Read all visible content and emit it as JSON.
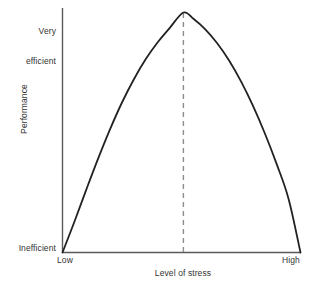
{
  "chart_data": {
    "type": "line",
    "title": "",
    "subtitle": "",
    "xlabel": "Level of stress",
    "ylabel": "Performance",
    "x_tick_labels": [
      "Low",
      "High"
    ],
    "y_tick_labels": [
      "Inefficient",
      "Very efficient"
    ],
    "y_top_label_lines": [
      "Very",
      "efficient"
    ],
    "grid": false,
    "legend": "none",
    "xlim": [
      0,
      1
    ],
    "ylim": [
      0,
      1
    ],
    "annotations": [
      {
        "name": "optimum-stress-marker",
        "style": "dashed-vertical-line",
        "x": 0.508,
        "y_from": 0.0,
        "y_to": 1.0,
        "color": "#8d8d8d"
      }
    ],
    "series": [
      {
        "name": "Performance vs level of stress",
        "shape": "inverted-u",
        "color": "#222222",
        "width": 1.8,
        "x": [
          0.0,
          0.05,
          0.1,
          0.15,
          0.2,
          0.25,
          0.3,
          0.35,
          0.4,
          0.45,
          0.508,
          0.55,
          0.6,
          0.65,
          0.7,
          0.75,
          0.8,
          0.85,
          0.9,
          0.95,
          1.0
        ],
        "y": [
          0.0,
          0.128,
          0.262,
          0.392,
          0.514,
          0.625,
          0.722,
          0.806,
          0.876,
          0.935,
          1.0,
          0.974,
          0.93,
          0.872,
          0.8,
          0.713,
          0.612,
          0.497,
          0.368,
          0.223,
          0.0
        ]
      }
    ]
  },
  "axes": {
    "x_axis_name": "level-of-stress-axis",
    "y_axis_name": "performance-axis",
    "axis_color": "#5a5a5a"
  },
  "labels": {
    "y_top": "Very efficient",
    "y_top_line1": "Very",
    "y_top_line2": "efficient",
    "y_bottom": "Inefficient",
    "y_title": "Performance",
    "x_left": "Low",
    "x_right": "High",
    "x_title": "Level of stress"
  }
}
